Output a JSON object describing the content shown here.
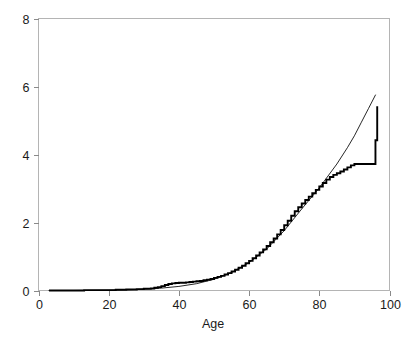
{
  "chart_data": {
    "type": "line",
    "title": "",
    "subtitle": "",
    "xlabel": "Age",
    "ylabel": "",
    "xlim": [
      0,
      100
    ],
    "ylim": [
      0,
      8
    ],
    "grid": false,
    "legend": "none",
    "xticks": [
      0,
      20,
      40,
      60,
      80,
      100
    ],
    "xtick_labels": [
      "0",
      "20",
      "40",
      "60",
      "80",
      "100"
    ],
    "yticks": [
      0,
      2,
      4,
      6,
      8
    ],
    "ytick_labels": [
      "0",
      "2",
      "4",
      "6",
      "8"
    ],
    "annotations": [],
    "series": [
      {
        "name": "empirical-step-estimate",
        "style": "step",
        "linewidth": "thick",
        "color": "#000000",
        "x": [
          3,
          8,
          13,
          18,
          22,
          25,
          28,
          30,
          32,
          33,
          34,
          35,
          36,
          37,
          38,
          39,
          40,
          41,
          42,
          43,
          44,
          45,
          46,
          47,
          48,
          49,
          50,
          51,
          52,
          53,
          54,
          55,
          56,
          57,
          58,
          59,
          60,
          61,
          62,
          63,
          64,
          65,
          66,
          67,
          68,
          69,
          70,
          71,
          72,
          73,
          74,
          75,
          76,
          77,
          78,
          79,
          80,
          81,
          82,
          83,
          84,
          85,
          86,
          87,
          88,
          89,
          90,
          91,
          96,
          96.5
        ],
        "y": [
          0.0,
          0.0,
          0.01,
          0.01,
          0.02,
          0.03,
          0.04,
          0.05,
          0.06,
          0.08,
          0.1,
          0.13,
          0.16,
          0.19,
          0.21,
          0.22,
          0.23,
          0.23,
          0.24,
          0.25,
          0.26,
          0.27,
          0.28,
          0.3,
          0.32,
          0.34,
          0.37,
          0.4,
          0.43,
          0.47,
          0.51,
          0.56,
          0.61,
          0.67,
          0.73,
          0.8,
          0.87,
          0.95,
          1.03,
          1.12,
          1.21,
          1.31,
          1.42,
          1.53,
          1.65,
          1.78,
          1.92,
          2.05,
          2.2,
          2.33,
          2.45,
          2.56,
          2.66,
          2.76,
          2.86,
          2.96,
          3.06,
          3.16,
          3.26,
          3.34,
          3.4,
          3.45,
          3.5,
          3.56,
          3.62,
          3.68,
          3.72,
          3.72,
          4.42,
          5.42
        ]
      },
      {
        "name": "fitted-smooth-curve",
        "style": "line",
        "linewidth": "thin",
        "color": "#000000",
        "x": [
          3,
          10,
          15,
          20,
          25,
          30,
          35,
          40,
          45,
          50,
          55,
          60,
          65,
          70,
          75,
          80,
          85,
          88,
          90,
          92,
          94,
          96
        ],
        "y": [
          0.0,
          0.0,
          0.005,
          0.01,
          0.02,
          0.04,
          0.07,
          0.12,
          0.2,
          0.33,
          0.53,
          0.82,
          1.22,
          1.76,
          2.4,
          3.02,
          3.72,
          4.2,
          4.55,
          4.95,
          5.35,
          5.75
        ]
      }
    ]
  }
}
